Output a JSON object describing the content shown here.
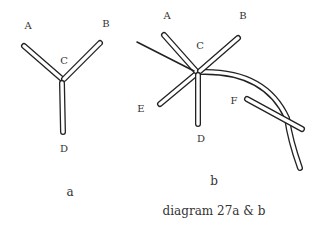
{
  "diagram": {
    "caption": "diagram 27a & b",
    "panels": [
      {
        "id": "a",
        "label": "a",
        "points": {
          "A": "A",
          "B": "B",
          "C": "C",
          "D": "D"
        }
      },
      {
        "id": "b",
        "label": "b",
        "points": {
          "A": "A",
          "B": "B",
          "C": "C",
          "D": "D",
          "E": "E",
          "F": "F"
        }
      }
    ],
    "colors": {
      "stroke": "#222222",
      "fill": "#ffffff",
      "text": "#333333"
    }
  }
}
